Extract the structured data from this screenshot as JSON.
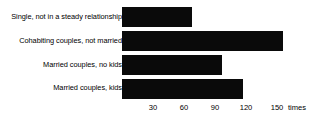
{
  "chart_data": {
    "type": "bar",
    "orientation": "horizontal",
    "title": "",
    "subtitle": "",
    "xlabel": "times",
    "ylabel": "",
    "categories": [
      "Single, not in a steady relationship",
      "Cohabiting couples, not married",
      "Married couples, no kids",
      "Married couples, kids"
    ],
    "values": [
      68,
      156,
      97,
      117
    ],
    "series": [
      {
        "name": "times",
        "values": [
          68,
          156,
          97,
          117
        ]
      }
    ],
    "xlim": [
      0,
      160
    ],
    "xticks": [
      30,
      60,
      90,
      120,
      150
    ],
    "xtick_labels": [
      "30",
      "60",
      "90",
      "120",
      "150"
    ],
    "unit_label": "times",
    "grid": false,
    "legend": false,
    "legend_position": "none",
    "bar_color": "#0a0a0a",
    "background_color": "#ffffff",
    "text_color": "#000000",
    "annotations": []
  }
}
